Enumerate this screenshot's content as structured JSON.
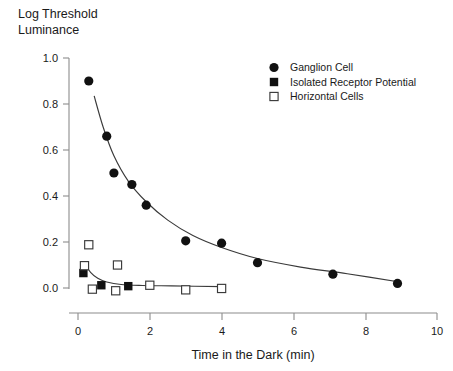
{
  "chart_data": {
    "type": "scatter",
    "title": "Log Threshold Luminance",
    "title_lines": [
      "Log Threshold",
      "Luminance"
    ],
    "xlabel": "Time in the Dark (min)",
    "ylabel": "Log Threshold Luminance",
    "xlim": [
      0,
      10
    ],
    "ylim": [
      0.0,
      1.0
    ],
    "xticks": [
      0,
      2,
      4,
      6,
      8,
      10
    ],
    "xtick_labels": [
      "0",
      "2",
      "4",
      "6",
      "8",
      "10"
    ],
    "yticks": [
      0.0,
      0.2,
      0.4,
      0.6,
      0.8,
      1.0
    ],
    "ytick_labels": [
      "0.0",
      "0.2",
      "0.4",
      "0.6",
      "0.8",
      "1.0"
    ],
    "grid": false,
    "legend_position": "top-right",
    "series": [
      {
        "name": "Ganglion Cell",
        "marker": "filled-circle",
        "color": "#111111",
        "points": [
          {
            "x": 0.3,
            "y": 0.9
          },
          {
            "x": 0.8,
            "y": 0.66
          },
          {
            "x": 1.0,
            "y": 0.5
          },
          {
            "x": 1.5,
            "y": 0.45
          },
          {
            "x": 1.9,
            "y": 0.36
          },
          {
            "x": 3.0,
            "y": 0.205
          },
          {
            "x": 4.0,
            "y": 0.195
          },
          {
            "x": 5.0,
            "y": 0.11
          },
          {
            "x": 7.1,
            "y": 0.06
          },
          {
            "x": 8.9,
            "y": 0.02
          }
        ],
        "fit_curve": {
          "description": "decaying exponential fit through ganglion cell points",
          "points": [
            {
              "x": 0.45,
              "y": 0.835
            },
            {
              "x": 0.7,
              "y": 0.7
            },
            {
              "x": 1.0,
              "y": 0.575
            },
            {
              "x": 1.4,
              "y": 0.465
            },
            {
              "x": 1.9,
              "y": 0.375
            },
            {
              "x": 2.5,
              "y": 0.295
            },
            {
              "x": 3.2,
              "y": 0.228
            },
            {
              "x": 4.0,
              "y": 0.176
            },
            {
              "x": 5.0,
              "y": 0.128
            },
            {
              "x": 6.2,
              "y": 0.091
            },
            {
              "x": 7.5,
              "y": 0.062
            },
            {
              "x": 9.0,
              "y": 0.025
            }
          ]
        }
      },
      {
        "name": "Isolated Receptor Potential",
        "marker": "filled-square",
        "color": "#111111",
        "points": [
          {
            "x": 0.15,
            "y": 0.065
          },
          {
            "x": 0.65,
            "y": 0.012
          },
          {
            "x": 1.4,
            "y": 0.008
          }
        ],
        "fit_curve": {
          "description": "fast decaying fit levelling near zero",
          "points": [
            {
              "x": 0.22,
              "y": 0.1
            },
            {
              "x": 0.35,
              "y": 0.068
            },
            {
              "x": 0.55,
              "y": 0.042
            },
            {
              "x": 0.8,
              "y": 0.026
            },
            {
              "x": 1.2,
              "y": 0.015
            },
            {
              "x": 1.8,
              "y": 0.011
            },
            {
              "x": 2.6,
              "y": 0.009
            },
            {
              "x": 4.0,
              "y": 0.006
            }
          ]
        }
      },
      {
        "name": "Horizontal Cells",
        "marker": "open-square",
        "color": "#3a3a3a",
        "points": [
          {
            "x": 0.3,
            "y": 0.188
          },
          {
            "x": 0.18,
            "y": 0.097
          },
          {
            "x": 1.1,
            "y": 0.1
          },
          {
            "x": 0.4,
            "y": -0.005
          },
          {
            "x": 1.05,
            "y": -0.012
          },
          {
            "x": 2.0,
            "y": 0.012
          },
          {
            "x": 3.0,
            "y": -0.008
          },
          {
            "x": 4.0,
            "y": -0.002
          }
        ]
      }
    ],
    "legend": [
      {
        "label": "Ganglion Cell",
        "marker": "filled-circle"
      },
      {
        "label": "Isolated Receptor Potential",
        "marker": "filled-square"
      },
      {
        "label": "Horizontal Cells",
        "marker": "open-square"
      }
    ]
  }
}
